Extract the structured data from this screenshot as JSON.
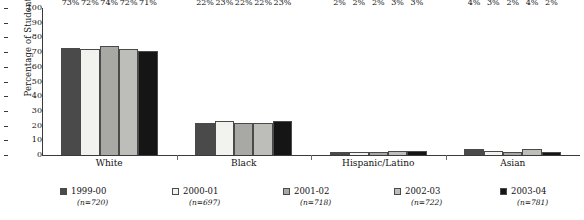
{
  "chart_data": {
    "type": "bar",
    "title": "",
    "xlabel": "",
    "ylabel": "Percentage of Students",
    "ylim": [
      0,
      100
    ],
    "ytick_step": 10,
    "yticks": [
      "100",
      "90",
      "80",
      "70",
      "60",
      "50",
      "40",
      "30",
      "20",
      "10",
      "0"
    ],
    "grid": false,
    "legend_position": "bottom",
    "value_suffix": "%",
    "categories": [
      "White",
      "Black",
      "Hispanic/Latino",
      "Asian"
    ],
    "series": [
      {
        "name": "1999-00",
        "n": "(n=720)",
        "color": "#4a4a4a",
        "values": [
          73,
          22,
          2,
          4
        ]
      },
      {
        "name": "2000-01",
        "n": "(n=697)",
        "color": "#f2f2ee",
        "values": [
          72,
          23,
          2,
          3
        ]
      },
      {
        "name": "2001-02",
        "n": "(n=718)",
        "color": "#a8a8a4",
        "values": [
          74,
          22,
          2,
          2
        ]
      },
      {
        "name": "2002-03",
        "n": "(n=722)",
        "color": "#bdbdb9",
        "values": [
          72,
          22,
          3,
          4
        ]
      },
      {
        "name": "2003-04",
        "n": "(n=781)",
        "color": "#151515",
        "values": [
          71,
          23,
          3,
          2
        ]
      }
    ],
    "data_labels": {
      "White": [
        "73%",
        "72%",
        "74%",
        "72%",
        "71%"
      ],
      "Black": [
        "22%",
        "23%",
        "22%",
        "22%",
        "23%"
      ],
      "Hispanic/Latino": [
        "2%",
        "2%",
        "2%",
        "3%",
        "3%"
      ],
      "Asian": [
        "4%",
        "3%",
        "2%",
        "4%",
        "2%"
      ]
    }
  }
}
